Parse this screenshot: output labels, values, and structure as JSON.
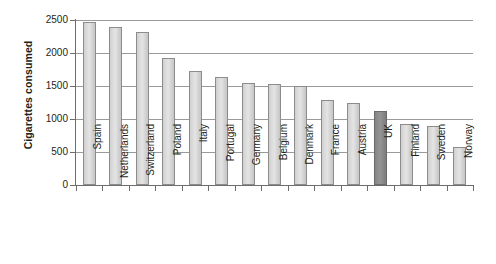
{
  "chart_data": {
    "type": "bar",
    "title": "",
    "subtitle": "",
    "xlabel": "",
    "ylabel": "Cigarettes consumed",
    "ylim": [
      0,
      2500
    ],
    "yticks": [
      0,
      500,
      1000,
      1500,
      2000,
      2500
    ],
    "ytick_labels": [
      "0",
      "500",
      "1000",
      "1500",
      "2000",
      "2500"
    ],
    "grid": true,
    "grid_axis": "y",
    "legend": false,
    "legend_position": "none",
    "orientation": "vertical",
    "categories": [
      "Spain",
      "Netherlands",
      "Switzerland",
      "Poland",
      "Italy",
      "Portugal",
      "Germany",
      "Belgium",
      "Denmark",
      "France",
      "Austria",
      "UK",
      "Finland",
      "Sweden",
      "Norway"
    ],
    "values": [
      2470,
      2390,
      2320,
      1930,
      1730,
      1630,
      1540,
      1530,
      1500,
      1290,
      1240,
      1120,
      920,
      890,
      580
    ],
    "highlighted_category": "UK",
    "colors": {
      "bar_fill": "#dadada",
      "bar_border": "#8c8c8c",
      "highlight_fill": "#8d8d8d",
      "highlight_border": "#6a6a6a",
      "gridline": "#9a9a9a",
      "axis": "#6d6d6d",
      "text": "#231f20",
      "background": "#ffffff"
    }
  }
}
